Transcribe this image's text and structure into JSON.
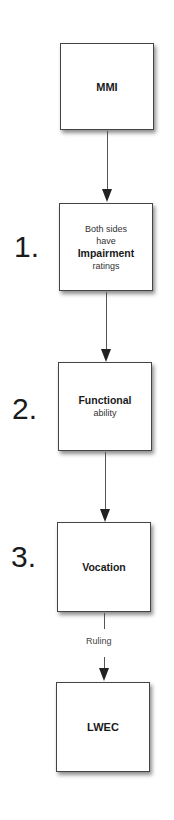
{
  "nodes": [
    {
      "id": "mmi",
      "lines": [
        {
          "text": "MMI",
          "bold": true
        }
      ]
    },
    {
      "id": "impairment",
      "lines": [
        {
          "text": "Both sides",
          "bold": false
        },
        {
          "text": "have",
          "bold": false
        },
        {
          "text": "Impairment",
          "bold": true
        },
        {
          "text": "ratings",
          "bold": false
        }
      ]
    },
    {
      "id": "functional",
      "lines": [
        {
          "text": "Functional",
          "bold": true
        },
        {
          "text": "ability",
          "bold": false
        }
      ]
    },
    {
      "id": "vocation",
      "lines": [
        {
          "text": "Vocation",
          "bold": true
        }
      ]
    },
    {
      "id": "lwec",
      "lines": [
        {
          "text": "LWEC",
          "bold": true
        }
      ]
    }
  ],
  "steps": [
    "1.",
    "2.",
    "3."
  ],
  "edges": [
    {
      "from": "mmi",
      "to": "impairment",
      "label": ""
    },
    {
      "from": "impairment",
      "to": "functional",
      "label": ""
    },
    {
      "from": "functional",
      "to": "vocation",
      "label": ""
    },
    {
      "from": "vocation",
      "to": "lwec",
      "label": "Ruling"
    }
  ]
}
